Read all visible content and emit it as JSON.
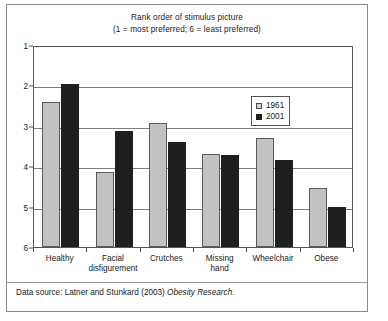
{
  "figure": {
    "title_line1": "Rank order of stimulus picture",
    "title_line2": "(1 = most preferred; 6 = least preferred)",
    "source_prefix": "Data source: Latner and Stunkard (2003) ",
    "source_journal": "Obesity Research",
    "source_suffix": "."
  },
  "legend": {
    "position": "inside-top-right",
    "entries": [
      {
        "label": "1961",
        "color": "#d2d2d2"
      },
      {
        "label": "2001",
        "color": "#1f1f1f"
      }
    ]
  },
  "chart_data": {
    "type": "bar",
    "title": "Rank order of stimulus picture (1 = most preferred; 6 = least preferred)",
    "xlabel": "",
    "ylabel": "",
    "ylim": [
      1,
      6
    ],
    "y_inverted": true,
    "grid": true,
    "y_ticks": [
      1,
      2,
      3,
      4,
      5,
      6
    ],
    "y_tick_labels": [
      "1",
      "2",
      "3",
      "4",
      "5",
      "6"
    ],
    "categories": [
      "Healthy",
      "Facial disfigurement",
      "Crutches",
      "Missing hand",
      "Wheelchair",
      "Obese"
    ],
    "category_lines": [
      [
        "Healthy"
      ],
      [
        "Facial",
        "disfigurement"
      ],
      [
        "Crutches"
      ],
      [
        "Missing",
        "hand"
      ],
      [
        "Wheelchair"
      ],
      [
        "Obese"
      ]
    ],
    "series": [
      {
        "name": "1961",
        "color": "#c2c2c2",
        "values": [
          2.4,
          4.15,
          2.93,
          3.7,
          3.3,
          4.55
        ]
      },
      {
        "name": "2001",
        "color": "#1f1f1f",
        "values": [
          1.97,
          3.13,
          3.4,
          3.72,
          3.85,
          5.0
        ]
      }
    ]
  }
}
